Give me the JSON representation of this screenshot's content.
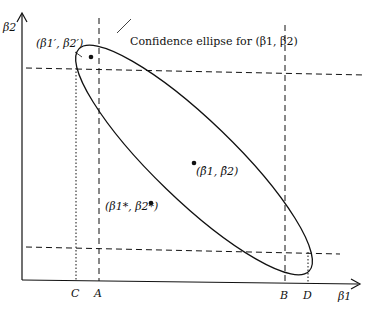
{
  "diagram": {
    "type": "confidence-ellipse",
    "axes": {
      "x_label": "β1",
      "y_label": "β2"
    },
    "ellipse_label": "Confidence ellipse for (β1, β2)",
    "points": [
      {
        "id": "beta-prime",
        "label": "(β1′, β2′)"
      },
      {
        "id": "beta-hat",
        "label": "(β̂1, β̂2)"
      },
      {
        "id": "beta-star",
        "label": "(β1*, β2*)"
      }
    ],
    "x_ticks": [
      {
        "label": "C",
        "style": "dotted"
      },
      {
        "label": "A",
        "style": "dashed"
      },
      {
        "label": "B",
        "style": "dashed"
      },
      {
        "label": "D",
        "style": "dotted"
      }
    ]
  }
}
